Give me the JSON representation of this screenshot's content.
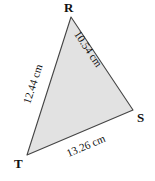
{
  "figure": {
    "type": "labeled-triangle-diagram",
    "background_color": "#ffffff",
    "fill_color": "#e2e2e2",
    "stroke_color": "#444444",
    "unit": "cm"
  },
  "vertices": [
    {
      "name": "R",
      "label": "R",
      "x": 71,
      "y": 17
    },
    {
      "name": "S",
      "label": "S",
      "x": 133,
      "y": 110
    },
    {
      "name": "T",
      "label": "T",
      "x": 27,
      "y": 155
    }
  ],
  "sides": [
    {
      "name": "RS",
      "from": "R",
      "to": "S",
      "label": "10.54 cm",
      "value": 10.54
    },
    {
      "name": "TR",
      "from": "T",
      "to": "R",
      "label": "12.44 cm",
      "value": 12.44
    },
    {
      "name": "TS",
      "from": "T",
      "to": "S",
      "label": "13.26 cm",
      "value": 13.26
    }
  ]
}
